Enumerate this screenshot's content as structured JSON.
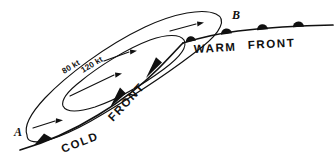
{
  "figure": {
    "type": "meteorological-cross-section-diagram",
    "background_color": "#ffffff",
    "ink_color": "#101010",
    "width": 335,
    "height": 165
  },
  "endpoints": {
    "left_label": "A",
    "right_label": "B"
  },
  "isotachs": [
    {
      "label": "80 kt",
      "speed_value": 80,
      "speed_unit": "kt"
    },
    {
      "label": "120 kt",
      "speed_value": 120,
      "speed_unit": "kt"
    }
  ],
  "fronts": [
    {
      "name": "cold-front",
      "word_one": "COLD",
      "word_two": "FRONT",
      "symbol": "filled-triangles",
      "symbol_count": 3
    },
    {
      "name": "warm-front",
      "word_one": "WARM",
      "word_two": "FRONT",
      "symbol": "filled-semicircles",
      "symbol_count": 4
    }
  ],
  "flow_arrows": {
    "count": 4,
    "direction": "left-to-right"
  }
}
